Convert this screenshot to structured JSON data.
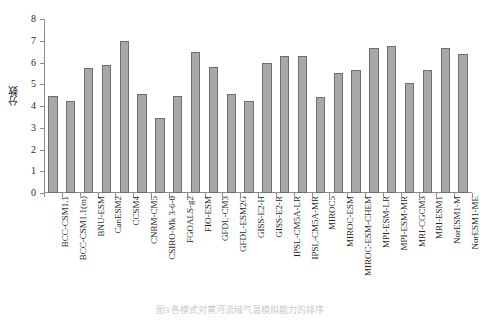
{
  "chart": {
    "ylabel": "分数",
    "caption": "图3 各模式对黄河流域气温模拟能力的排序",
    "bar_color": "#a8a8a8",
    "bar_edge_color": "#6e6e6e",
    "axis_color": "#8c8c8c"
  },
  "chart_data": {
    "type": "bar",
    "title": "",
    "xlabel": "",
    "ylabel": "分数",
    "ylim": [
      0,
      8
    ],
    "yticks": [
      0,
      1,
      2,
      3,
      4,
      5,
      6,
      7,
      8
    ],
    "grid": false,
    "legend": "none",
    "categories": [
      "BCC-CSM1.1",
      "BCC-CSM1.1(m)",
      "BNU-ESM",
      "CanESM2",
      "CCSM4",
      "CNRM-CM5",
      "CSIRO-Mk 3-6-0",
      "FGOALS-g2",
      "FIO-ESM",
      "GFDL-CM3",
      "GFDL-ESM2G",
      "GISS-E2-H",
      "GISS-E2-R",
      "IPSL-CM5A-LR",
      "IPSL-CM5A-MR",
      "MIROC5",
      "MIROC-ESM",
      "MIROC-ESM-CHEM",
      "MPI-ESM-LR",
      "MPI-ESM-MR",
      "MRI-CGCM3",
      "MRI-ESM1",
      "NorESM1-M",
      "NorESM1-ME"
    ],
    "values": [
      4.45,
      4.25,
      5.75,
      5.9,
      7.0,
      4.55,
      3.45,
      4.45,
      6.5,
      5.8,
      4.55,
      4.25,
      6.0,
      6.3,
      6.3,
      4.4,
      5.5,
      5.65,
      6.65,
      6.75,
      5.05,
      5.65,
      6.65,
      6.4
    ]
  }
}
